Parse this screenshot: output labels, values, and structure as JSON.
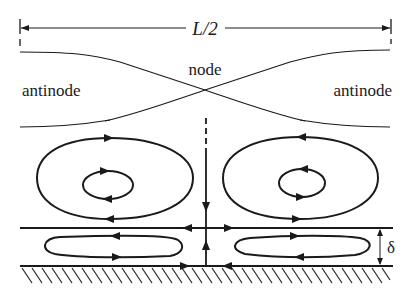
{
  "figure": {
    "type": "acoustic streaming diagram",
    "dimension_label": "L/2",
    "labels": {
      "node": "node",
      "antinode_left": "antinode",
      "antinode_right": "antinode",
      "boundary_layer_thickness": "δ"
    },
    "colors": {
      "ink": "#1a1a1a",
      "background": "#ffffff"
    },
    "elements": [
      "L/2 dimension line with end arrows",
      "standing-wave amplitude envelope (two crossing curves)",
      "outer streaming vortex (left, clockwise)",
      "outer streaming vortex (right, counter-clockwise)",
      "inner boundary-layer vortex (left)",
      "inner boundary-layer vortex (right)",
      "center vertical streamline with dashed top",
      "boundary layer edge line",
      "solid wall with hatching",
      "delta thickness indicator"
    ]
  }
}
